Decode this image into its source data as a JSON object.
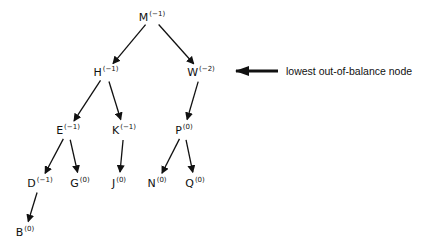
{
  "diagram": {
    "type": "avl-tree",
    "nodes": [
      {
        "id": "M",
        "label": "M",
        "balance": "(−1)",
        "x": 152,
        "y": 17
      },
      {
        "id": "H",
        "label": "H",
        "balance": "(−1)",
        "x": 106,
        "y": 72
      },
      {
        "id": "W",
        "label": "W",
        "balance": "(−2)",
        "x": 201,
        "y": 72
      },
      {
        "id": "E",
        "label": "E",
        "balance": "(−1)",
        "x": 68,
        "y": 130
      },
      {
        "id": "K",
        "label": "K",
        "balance": "(−1)",
        "x": 124,
        "y": 130
      },
      {
        "id": "P",
        "label": "P",
        "balance": "(0)",
        "x": 184,
        "y": 130
      },
      {
        "id": "D",
        "label": "D",
        "balance": "(−1)",
        "x": 40,
        "y": 183
      },
      {
        "id": "G",
        "label": "G",
        "balance": "(0)",
        "x": 80,
        "y": 183
      },
      {
        "id": "J",
        "label": "J",
        "balance": "(0)",
        "x": 119,
        "y": 183
      },
      {
        "id": "N",
        "label": "N",
        "balance": "(0)",
        "x": 157,
        "y": 183
      },
      {
        "id": "Q",
        "label": "Q",
        "balance": "(0)",
        "x": 195,
        "y": 183
      },
      {
        "id": "B",
        "label": "B",
        "balance": "(0)",
        "x": 25,
        "y": 232
      }
    ],
    "edges": [
      [
        "M",
        "H"
      ],
      [
        "M",
        "W"
      ],
      [
        "H",
        "E"
      ],
      [
        "H",
        "K"
      ],
      [
        "W",
        "P"
      ],
      [
        "E",
        "D"
      ],
      [
        "E",
        "G"
      ],
      [
        "K",
        "J"
      ],
      [
        "P",
        "N"
      ],
      [
        "P",
        "Q"
      ],
      [
        "D",
        "B"
      ]
    ],
    "annotation": {
      "text": "lowest out-of-balance node",
      "points_to": "W"
    }
  }
}
